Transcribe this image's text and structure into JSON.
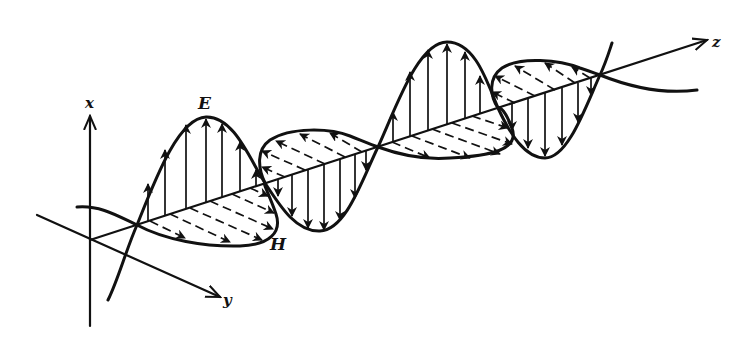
{
  "figure": {
    "labels": {
      "x_axis": "x",
      "y_axis": "y",
      "z_axis": "z",
      "electric_field": "E",
      "magnetic_field": "H"
    },
    "colors": {
      "ink": "#111111",
      "background": "#ffffff"
    },
    "geometry": {
      "origin": [
        90,
        240
      ],
      "z_axis_tip": [
        707,
        40
      ],
      "nodes": [
        [
          137,
          225
        ],
        [
          265,
          183
        ],
        [
          378,
          147
        ],
        [
          498,
          108
        ],
        [
          600,
          75
        ]
      ],
      "e_extrema": [
        [
          206,
          117
        ],
        [
          320,
          230
        ],
        [
          447,
          42
        ],
        [
          545,
          158
        ]
      ],
      "h_extrema": [
        [
          228,
          245
        ],
        [
          310,
          129
        ],
        [
          440,
          158
        ],
        [
          535,
          60
        ]
      ]
    }
  }
}
